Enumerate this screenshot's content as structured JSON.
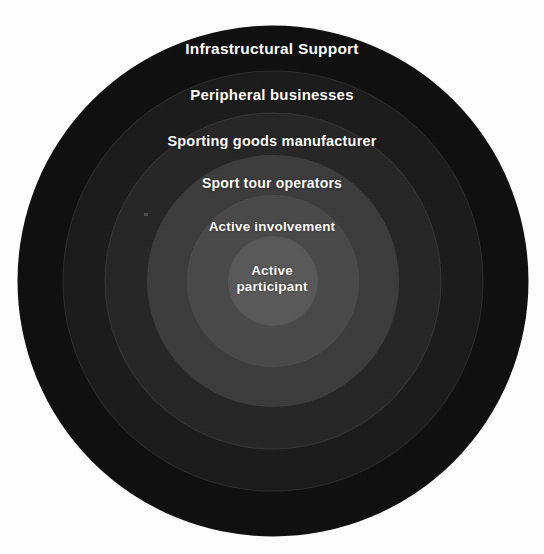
{
  "diagram": {
    "type": "concentric-circles",
    "background_color": "#ffffff",
    "label_color": "#ffffff",
    "center_x": 273,
    "center_y": 281,
    "levels": [
      {
        "index": 1,
        "label": "Infrastructural Support",
        "color": "#100f0f",
        "diameter": 511,
        "position": "outermost"
      },
      {
        "index": 2,
        "label": "Peripheral businesses",
        "color": "#1c1b1b",
        "diameter": 419,
        "position": "ring"
      },
      {
        "index": 3,
        "label": "Sporting goods manufacturer",
        "color": "#272626",
        "diameter": 335,
        "position": "ring"
      },
      {
        "index": 4,
        "label": "Sport tour operators",
        "color": "#3d3c3c",
        "diameter": 250,
        "position": "ring"
      },
      {
        "index": 5,
        "label": "Active involvement",
        "color": "#4a4949",
        "diameter": 170,
        "position": "ring"
      },
      {
        "index": 6,
        "label": "Active participant",
        "label_line_1": "Active",
        "label_line_2": "participant",
        "color": "#5a5959",
        "diameter": 88,
        "position": "innermost"
      }
    ]
  }
}
